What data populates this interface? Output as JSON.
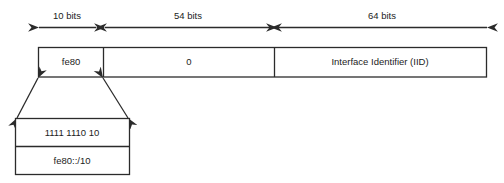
{
  "diagram": {
    "colors": {
      "line": "#2b2b2b",
      "background": "#ffffff",
      "text": "#1c1c1c"
    },
    "dimensions": [
      {
        "name": "prefix-width",
        "label": "10 bits"
      },
      {
        "name": "zeroes-width",
        "label": "54 bits"
      },
      {
        "name": "iid-width",
        "label": "64 bits"
      }
    ],
    "address_fields": [
      {
        "name": "prefix",
        "label": "fe80"
      },
      {
        "name": "zeroes",
        "label": "0"
      },
      {
        "name": "interface-identifier",
        "label": "Interface Identifier (IID)"
      }
    ],
    "callout": {
      "rows": [
        {
          "name": "binary-prefix",
          "label": "1111 1110 10"
        },
        {
          "name": "prefix-notation",
          "label": "fe80::/10"
        }
      ]
    }
  }
}
